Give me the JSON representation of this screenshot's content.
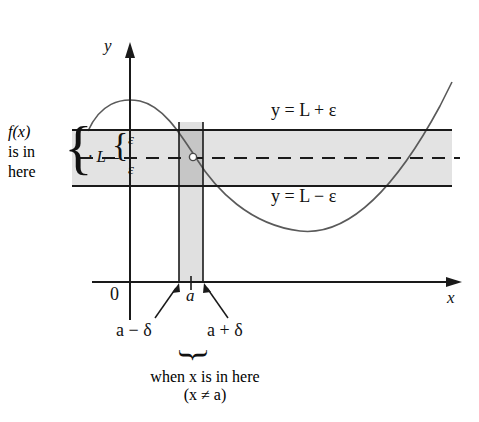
{
  "figure": {
    "axes": {
      "y_axis_label": "y",
      "x_axis_label": "x",
      "origin_label": "0",
      "tick_label_a": "a"
    },
    "band": {
      "upper_line_label": "y = L + ε",
      "lower_line_label": "y = L − ε",
      "center_label": "L",
      "epsilon_upper_label": "ε",
      "epsilon_lower_label": "ε",
      "fill_color": "#e3e3e3",
      "line_color": "#1a1a1a"
    },
    "strip": {
      "left_label": "a − δ",
      "right_label": "a + δ",
      "fill_color": "#e0e0e0",
      "overlap_color": "#c6c6c6"
    },
    "annotations": {
      "fx_line1": "f(x)",
      "fx_line2": "is in",
      "fx_line3": "here",
      "when_line1": "when x is in here",
      "when_line2": "(x ≠ a)"
    },
    "curve": {
      "color": "#555555",
      "hole_point_label": "open circle at (a, L)"
    }
  }
}
